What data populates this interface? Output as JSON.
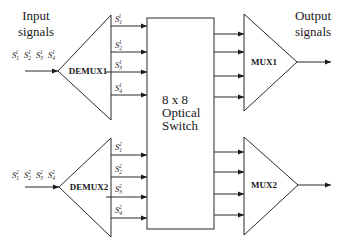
{
  "diagram": {
    "title_left": [
      "Input",
      "signals"
    ],
    "title_right": [
      "Output",
      "signals"
    ],
    "switch": {
      "lines": [
        "8 x 8",
        "Optical",
        "Switch"
      ]
    },
    "demux": [
      {
        "label": "DEMUX1",
        "group": 1
      },
      {
        "label": "DEMUX2",
        "group": 2
      }
    ],
    "mux": [
      {
        "label": "MUX1"
      },
      {
        "label": "MUX2"
      }
    ],
    "input_signals": [
      {
        "group": 1,
        "signals": [
          {
            "base": "S",
            "sub": "1",
            "sup": "1"
          },
          {
            "base": "S",
            "sub": "2",
            "sup": "1"
          },
          {
            "base": "S",
            "sub": "3",
            "sup": "1"
          },
          {
            "base": "S",
            "sub": "4",
            "sup": "1"
          }
        ]
      },
      {
        "group": 2,
        "signals": [
          {
            "base": "S",
            "sub": "1",
            "sup": "2"
          },
          {
            "base": "S",
            "sub": "2",
            "sup": "2"
          },
          {
            "base": "S",
            "sub": "3",
            "sup": "2"
          },
          {
            "base": "S",
            "sub": "4",
            "sup": "2"
          }
        ]
      }
    ],
    "colors": {
      "line": "#2a2a2a",
      "text": "#1a1a1a",
      "background": "#ffffff"
    }
  }
}
